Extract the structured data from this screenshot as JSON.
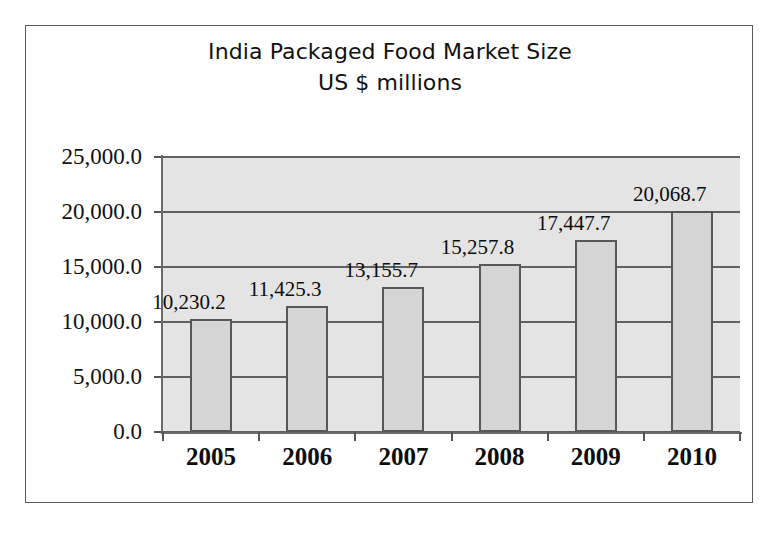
{
  "chart_data": {
    "type": "bar",
    "title": "India Packaged Food Market Size",
    "subtitle": "US $ millions",
    "xlabel": "",
    "ylabel": "",
    "categories": [
      "2005",
      "2006",
      "2007",
      "2008",
      "2009",
      "2010"
    ],
    "values": [
      10230.2,
      11425.3,
      13155.7,
      15257.8,
      17447.7,
      20068.7
    ],
    "data_labels": [
      "10,230.2",
      "11,425.3",
      "13,155.7",
      "15,257.8",
      "17,447.7",
      "20,068.7"
    ],
    "ylim": [
      0,
      25000
    ],
    "ytick_values": [
      0,
      5000,
      10000,
      15000,
      20000,
      25000
    ],
    "ytick_labels": [
      "0.0",
      "5,000.0",
      "10,000.0",
      "15,000.0",
      "20,000.0",
      "25,000.0"
    ],
    "grid": true,
    "legend": false,
    "legend_position": "none",
    "colors": {
      "bar_fill": "#d5d5d5",
      "bar_border": "#575757",
      "plot_background": "#e4e4e4",
      "gridline": "#606060",
      "text": "#111111",
      "frame_border": "#5a5a5a",
      "page_background": "#ffffff"
    }
  }
}
